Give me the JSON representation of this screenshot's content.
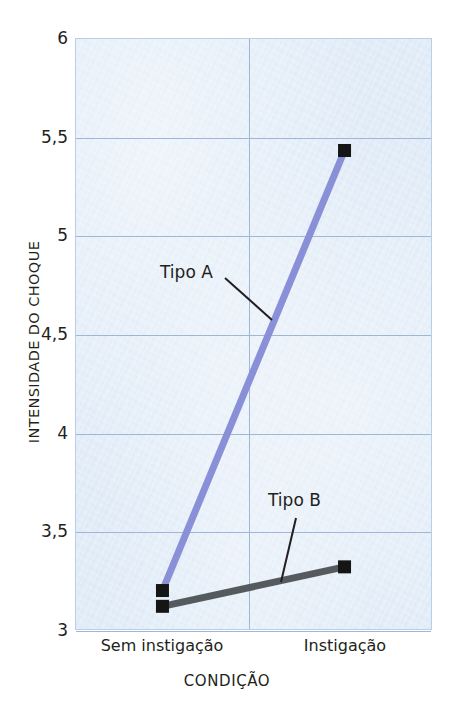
{
  "chart_data": {
    "type": "line",
    "title": "",
    "subtitle": "",
    "xlabel": "CONDIÇÃO",
    "ylabel": "INTENSIDADE DO CHOQUE",
    "categories": [
      "Sem instigação",
      "Instigação"
    ],
    "ylim": [
      3,
      6
    ],
    "yticks": [
      3,
      3.5,
      4,
      4.5,
      5,
      5.5,
      6
    ],
    "ytick_labels": [
      "3",
      "3,5",
      "4",
      "4,5",
      "5",
      "5,5",
      "6"
    ],
    "xtick_labels": [
      "Sem instigação",
      "Instigação"
    ],
    "decimal_separator": ",",
    "grid": true,
    "legend_position": "inline-annotation",
    "series": [
      {
        "name": "Tipo A",
        "values": [
          3.2,
          5.43
        ],
        "color": "#8a90d8",
        "marker": "filled-square",
        "marker_color": "#151515",
        "line_width": 7
      },
      {
        "name": "Tipo B",
        "values": [
          3.12,
          3.32
        ],
        "color": "#555a5e",
        "marker": "filled-square",
        "marker_color": "#151515",
        "line_width": 7
      }
    ],
    "annotations": [
      {
        "text": "Tipo A",
        "points_to_series": "Tipo A"
      },
      {
        "text": "Tipo B",
        "points_to_series": "Tipo B"
      }
    ],
    "plot_background": "#dbe8f6",
    "grid_color": "#9fb6d8"
  },
  "axes": {
    "y_label": "INTENSIDADE DO CHOQUE",
    "x_label": "CONDIÇÃO",
    "y_ticks": [
      "6",
      "5,5",
      "5",
      "4,5",
      "4",
      "3,5",
      "3"
    ],
    "x_ticks": [
      "Sem instigação",
      "Instigação"
    ]
  },
  "annotations": {
    "tipo_a": "Tipo A",
    "tipo_b": "Tipo B"
  }
}
